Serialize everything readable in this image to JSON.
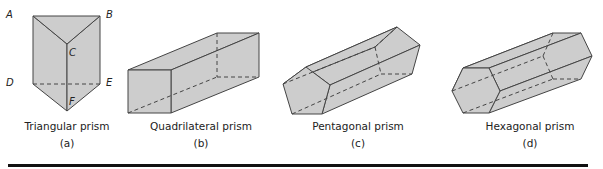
{
  "style": {
    "fill_color": "#cdcdcd",
    "stroke_color": "#444444",
    "rule_color": "#111111"
  },
  "figures": [
    {
      "name": "Triangular prism",
      "sublabel": "(a)",
      "vertex_labels": [
        "A",
        "B",
        "C",
        "D",
        "E",
        "F"
      ]
    },
    {
      "name": "Quadrilateral prism",
      "sublabel": "(b)"
    },
    {
      "name": "Pentagonal prism",
      "sublabel": "(c)"
    },
    {
      "name": "Hexagonal prism",
      "sublabel": "(d)"
    }
  ]
}
